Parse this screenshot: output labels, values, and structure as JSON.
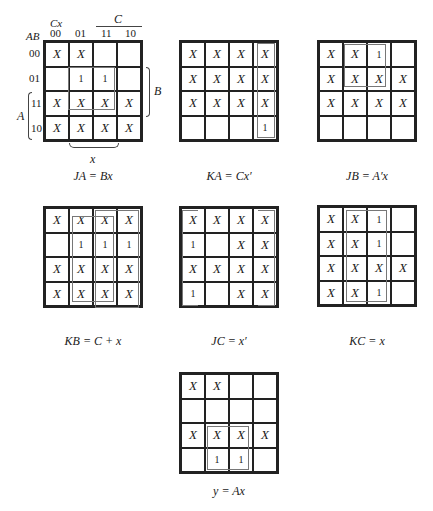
{
  "axis_labels": {
    "row_vars": "AB",
    "col_vars": "Cx",
    "col_headers": [
      "00",
      "01",
      "11",
      "10"
    ],
    "row_headers": [
      "00",
      "01",
      "11",
      "10"
    ],
    "var_C": "C",
    "var_B": "B",
    "var_A": "A",
    "var_x": "x"
  },
  "maps": [
    {
      "id": "JA",
      "caption": "JA = Bx",
      "cells": [
        [
          "X",
          "X",
          "",
          ""
        ],
        [
          "",
          "1",
          "1",
          ""
        ],
        [
          "X",
          "X",
          "X",
          "X"
        ],
        [
          "X",
          "X",
          "X",
          "X"
        ]
      ]
    },
    {
      "id": "KA",
      "caption": "KA = Cx′",
      "cells": [
        [
          "X",
          "X",
          "X",
          "X"
        ],
        [
          "X",
          "X",
          "X",
          "X"
        ],
        [
          "X",
          "X",
          "X",
          "X"
        ],
        [
          "",
          "",
          "",
          "1"
        ]
      ]
    },
    {
      "id": "JB",
      "caption": "JB = A′x",
      "cells": [
        [
          "X",
          "X",
          "1",
          ""
        ],
        [
          "X",
          "X",
          "X",
          "X"
        ],
        [
          "X",
          "X",
          "X",
          "X"
        ],
        [
          "",
          "",
          "",
          ""
        ]
      ]
    },
    {
      "id": "KB",
      "caption": "KB = C + x",
      "cells": [
        [
          "X",
          "X",
          "X",
          "X"
        ],
        [
          "",
          "1",
          "1",
          "1"
        ],
        [
          "X",
          "X",
          "X",
          "X"
        ],
        [
          "X",
          "X",
          "X",
          "X"
        ]
      ]
    },
    {
      "id": "JC",
      "caption": "JC = x′",
      "cells": [
        [
          "X",
          "X",
          "X",
          "X"
        ],
        [
          "1",
          "",
          "X",
          "X"
        ],
        [
          "X",
          "X",
          "X",
          "X"
        ],
        [
          "1",
          "",
          "X",
          "X"
        ]
      ]
    },
    {
      "id": "KC",
      "caption": "KC = x",
      "cells": [
        [
          "X",
          "X",
          "1",
          ""
        ],
        [
          "X",
          "X",
          "1",
          ""
        ],
        [
          "X",
          "X",
          "X",
          "X"
        ],
        [
          "X",
          "X",
          "1",
          ""
        ]
      ]
    },
    {
      "id": "y",
      "caption": "y = Ax",
      "cells": [
        [
          "X",
          "X",
          "",
          ""
        ],
        [
          "",
          "",
          "",
          ""
        ],
        [
          "X",
          "X",
          "X",
          "X"
        ],
        [
          "",
          "1",
          "1",
          ""
        ]
      ]
    }
  ]
}
